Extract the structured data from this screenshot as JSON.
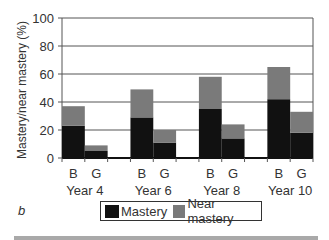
{
  "chart_data": {
    "type": "bar",
    "stacked": true,
    "title": "",
    "panel_label": "b",
    "xlabel": "",
    "ylabel": "Mastery/near mastery (%)",
    "ylim": [
      0,
      100
    ],
    "yticks": [
      0,
      20,
      40,
      60,
      80,
      100
    ],
    "grid": true,
    "groups": [
      "Year 4",
      "Year 6",
      "Year 8",
      "Year 10"
    ],
    "subcategories": [
      "B",
      "G"
    ],
    "categories": [
      "Year 4 B",
      "Year 4 G",
      "Year 6 B",
      "Year 6 G",
      "Year 8 B",
      "Year 8 G",
      "Year 10 B",
      "Year 10 G"
    ],
    "series": [
      {
        "name": "Mastery",
        "color": "#111111",
        "values": [
          23,
          5,
          29,
          11,
          35,
          14,
          42,
          18
        ]
      },
      {
        "name": "Near mastery",
        "color": "#7a7a7a",
        "values": [
          14,
          4,
          20,
          9,
          23,
          10,
          23,
          15
        ]
      }
    ],
    "totals": [
      37,
      9,
      49,
      20,
      58,
      24,
      65,
      33
    ],
    "legend_position": "bottom"
  },
  "labels": {
    "ylabel": "Mastery/near mastery (%)",
    "panel": "b",
    "legend_mastery": "Mastery",
    "legend_near": "Near mastery"
  }
}
